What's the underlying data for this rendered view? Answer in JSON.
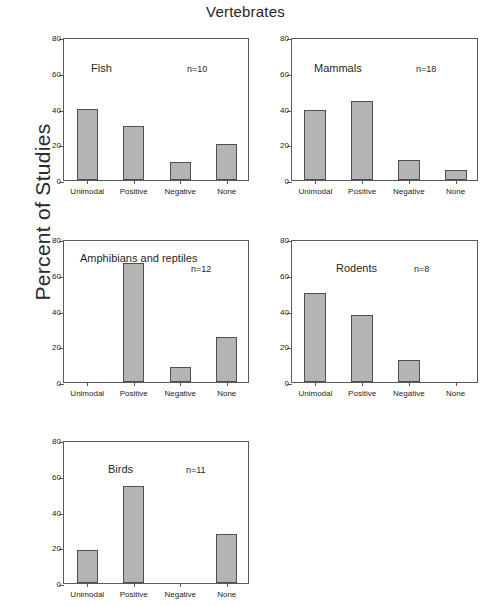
{
  "figure": {
    "title": "Vertebrates",
    "ylabel": "Percent of Studies"
  },
  "chart_data": {
    "type": "bar",
    "title": "Vertebrates",
    "xlabel": "",
    "ylabel": "Percent of Studies",
    "ylim": [
      0,
      80
    ],
    "yticks": [
      0,
      20,
      40,
      60,
      80
    ],
    "grid": false,
    "legend": "none",
    "categories": [
      "Unimodal",
      "Positive",
      "Negative",
      "None"
    ],
    "panel_layout": "2 x 2 plus 1 (5 panels)",
    "panels": [
      {
        "name": "Fish",
        "n_label": "n=10",
        "n": 10,
        "values": [
          40,
          30,
          10,
          20
        ]
      },
      {
        "name": "Mammals",
        "n_label": "n=18",
        "n": 18,
        "values": [
          38.9,
          44.4,
          11.1,
          5.6
        ]
      },
      {
        "name": "Amphibians and reptiles",
        "n_label": "n=12",
        "n": 12,
        "values": [
          0,
          66.7,
          8.3,
          25
        ]
      },
      {
        "name": "Rodents",
        "n_label": "n=8",
        "n": 8,
        "values": [
          50,
          37.5,
          12.5,
          0
        ]
      },
      {
        "name": "Birds",
        "n_label": "n=11",
        "n": 11,
        "values": [
          18.2,
          54.5,
          0,
          27.3
        ]
      }
    ],
    "colors": {
      "bar_fill": "#b4b4b4",
      "bar_edge": "#4f4f4f",
      "axis": "#5a5a5a",
      "text": "#1f1f1f",
      "background": "#ffffff"
    }
  }
}
